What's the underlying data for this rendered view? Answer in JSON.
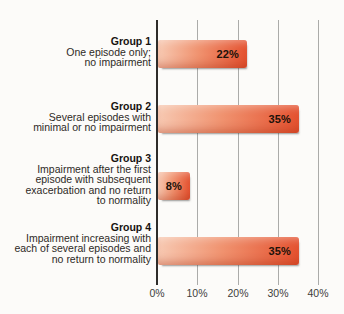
{
  "chart_data": {
    "type": "bar",
    "orientation": "horizontal",
    "title": "",
    "xlabel": "",
    "ylabel": "",
    "xlim": [
      0,
      40
    ],
    "grid": true,
    "x_tick_labels": [
      "0%",
      "10%",
      "20%",
      "30%",
      "40%"
    ],
    "x_tick_values": [
      0,
      10,
      20,
      30,
      40
    ],
    "groups": [
      {
        "name": "Group 1",
        "desc": [
          "One episode only;",
          "no impairment"
        ],
        "value": 22,
        "value_label": "22%"
      },
      {
        "name": "Group 2",
        "desc": [
          "Several episodes with",
          "minimal or no impairment"
        ],
        "value": 35,
        "value_label": "35%"
      },
      {
        "name": "Group 3",
        "desc": [
          "Impairment after the first",
          "episode with subsequent",
          "exacerbation and no return",
          "to normality"
        ],
        "value": 8,
        "value_label": "8%"
      },
      {
        "name": "Group 4",
        "desc": [
          "Impairment increasing with",
          "each of several episodes and",
          "no return to normality"
        ],
        "value": 35,
        "value_label": "35%"
      }
    ],
    "colors": {
      "bar_gradient_start": "#f7c9b2",
      "bar_gradient_end": "#e4512f",
      "gridline": "#ababa9",
      "axis": "#2e2c2a",
      "text": "#2e2a26"
    }
  }
}
